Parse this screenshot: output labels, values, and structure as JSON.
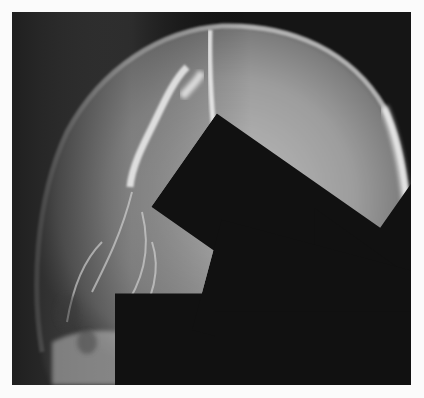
{
  "figure": {
    "panel_label": "A",
    "colors": {
      "background_margin": "#fbfbfb",
      "film_dark": "#141414",
      "bone": "#e6e6e6",
      "arrow": "#111111"
    },
    "arrows": [
      {
        "id": 1,
        "direction": "down-right",
        "x": 150,
        "y": 90
      },
      {
        "id": 2,
        "direction": "right",
        "x": 121,
        "y": 166
      },
      {
        "id": 3,
        "direction": "right",
        "x": 206,
        "y": 142
      },
      {
        "id": 4,
        "direction": "right",
        "x": 221,
        "y": 184
      }
    ]
  }
}
